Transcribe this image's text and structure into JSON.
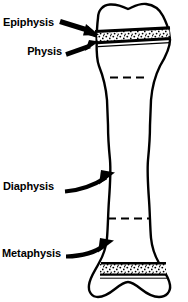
{
  "figure": {
    "background_color": "#ffffff",
    "ink_color": "#000000",
    "width": 188,
    "height": 302
  },
  "labels": {
    "epiphysis": "Epiphysis",
    "physis": "Physis",
    "diaphysis": "Diaphysis",
    "metaphysis": "Metaphysis"
  },
  "annotations": [
    {
      "id": "epiphysis",
      "label": "Epiphysis",
      "pointer": "arrow-straight-right",
      "points_to": "proximal-epiphysis"
    },
    {
      "id": "physis",
      "label": "Physis",
      "pointer": "arrow-straight-right",
      "points_to": "proximal-growth-plate"
    },
    {
      "id": "diaphysis",
      "label": "Diaphysis",
      "pointer": "arrow-curved-up-right",
      "points_to": "bone-shaft"
    },
    {
      "id": "metaphysis",
      "label": "Metaphysis",
      "pointer": "arrow-curved-up-right",
      "points_to": "distal-metaphysis"
    }
  ],
  "bone_parts": [
    {
      "id": "proximal-epiphysis",
      "name": "proximal epiphysis",
      "fill": "white",
      "description": "rounded bilobed head at top"
    },
    {
      "id": "proximal-growth-plate",
      "name": "proximal physis",
      "fill": "stippled",
      "description": "stippled band bounded by solid lines"
    },
    {
      "id": "proximal-metaphysis-line",
      "name": "proximal metaphysis boundary",
      "style": "dashed"
    },
    {
      "id": "bone-shaft",
      "name": "diaphysis",
      "fill": "white",
      "description": "narrow waisted shaft"
    },
    {
      "id": "distal-metaphysis-line",
      "name": "distal metaphysis boundary",
      "style": "dashed"
    },
    {
      "id": "distal-growth-plate",
      "name": "distal physis",
      "fill": "stippled",
      "description": "stippled band bounded by solid lines"
    },
    {
      "id": "distal-epiphysis",
      "name": "distal epiphysis",
      "fill": "white",
      "description": "bilobed condylar end at bottom"
    }
  ]
}
